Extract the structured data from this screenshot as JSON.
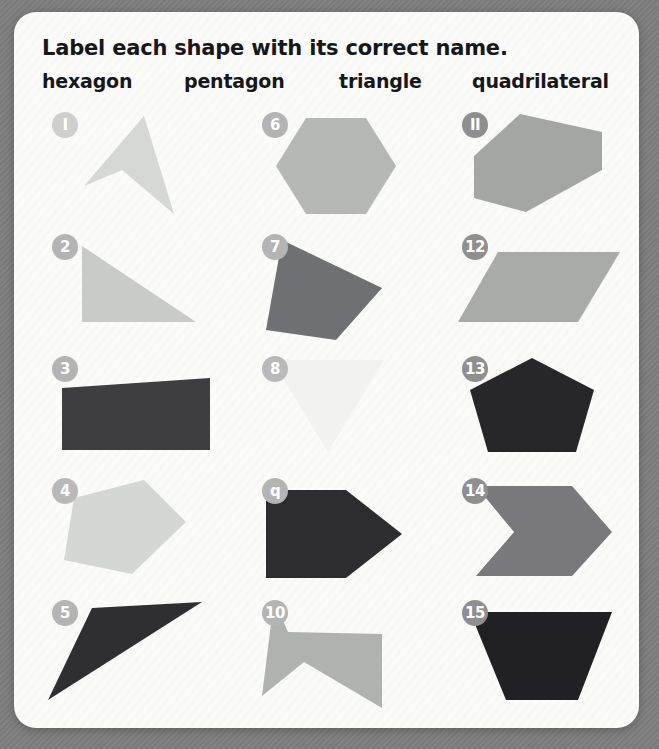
{
  "page": {
    "background_color": "#7e7e7e",
    "card_color": "#fbfbfa"
  },
  "header": {
    "instruction": "Label each shape with its correct name.",
    "word_bank": [
      "hexagon",
      "pentagon",
      "triangle",
      "quadrilateral"
    ]
  },
  "grid": {
    "columns": 3,
    "rows": 5,
    "column_x": [
      30,
      240,
      440
    ],
    "row_y": [
      0,
      122,
      244,
      366,
      488
    ]
  },
  "shapes": [
    {
      "number": "1",
      "badge_label": "I",
      "badge_color": "#cfcfcf",
      "fill": "#d6d8d5",
      "shape_kind": "concave-quadrilateral",
      "points": "100,8 130,106 78,62 40,78",
      "col": 0,
      "row": 0
    },
    {
      "number": "2",
      "badge_label": "2",
      "badge_color": "#b4b4b4",
      "fill": "#c9cbc8",
      "shape_kind": "right-triangle",
      "points": "38,16 38,92 152,92",
      "col": 0,
      "row": 1
    },
    {
      "number": "3",
      "badge_label": "3",
      "badge_color": "#b4b4b4",
      "fill": "#3e3e40",
      "shape_kind": "slanted-quadrilateral",
      "points": "18,36 166,26 166,98 18,98",
      "col": 0,
      "row": 2
    },
    {
      "number": "4",
      "badge_label": "4",
      "badge_color": "#b9b9b9",
      "fill": "#d5d7d4",
      "shape_kind": "rotated-pentagon",
      "points": "30,24 100,6 142,48 88,100 20,86",
      "col": 0,
      "row": 3
    },
    {
      "number": "5",
      "badge_label": "5",
      "badge_color": "#b4b4b4",
      "fill": "#2f2f31",
      "shape_kind": "thin-triangle",
      "points": "48,12 158,6 4,104",
      "col": 0,
      "row": 4
    },
    {
      "number": "6",
      "badge_label": "6",
      "badge_color": "#b4b4b4",
      "fill": "#b6b8b5",
      "shape_kind": "hexagon",
      "points": "52,10 112,10 142,58 112,106 52,106 22,58",
      "col": 1,
      "row": 0
    },
    {
      "number": "7",
      "badge_label": "7",
      "badge_color": "#b4b4b4",
      "fill": "#6e7072",
      "shape_kind": "quadrilateral-kite",
      "points": "28,10 128,58 82,110 12,100",
      "col": 1,
      "row": 1
    },
    {
      "number": "8",
      "badge_label": "8",
      "badge_color": "#b9b9b9",
      "fill": "#f2f2f0",
      "shape_kind": "inverted-triangle",
      "points": "18,8 130,8 74,100",
      "col": 1,
      "row": 2
    },
    {
      "number": "9",
      "badge_label": "q",
      "badge_color": "#b4b4b4",
      "fill": "#2d2d2f",
      "shape_kind": "arrow-pentagon",
      "points": "12,16 92,16 148,60 92,104 12,104",
      "col": 1,
      "row": 3
    },
    {
      "number": "10",
      "badge_label": "10",
      "badge_color": "#b4b4b4",
      "fill": "#b0b2af",
      "shape_kind": "concave-hexagon",
      "points": "20,4 34,36 128,38 128,112 50,66 8,100",
      "col": 1,
      "row": 4
    },
    {
      "number": "11",
      "badge_label": "II",
      "badge_color": "#8f8f8f",
      "fill": "#a4a6a3",
      "shape_kind": "elongated-hexagon",
      "points": "66,6 148,24 148,62 72,104 20,90 20,48",
      "col": 2,
      "row": 0
    },
    {
      "number": "12",
      "badge_label": "12",
      "badge_color": "#8f8f8f",
      "fill": "#a9aba8",
      "shape_kind": "parallelogram",
      "points": "44,22 166,22 124,92 4,92",
      "col": 2,
      "row": 1
    },
    {
      "number": "13",
      "badge_label": "13",
      "badge_color": "#8f8f8f",
      "fill": "#272729",
      "shape_kind": "pentagon",
      "points": "78,6 140,38 122,100 34,100 16,38",
      "col": 2,
      "row": 2
    },
    {
      "number": "14",
      "badge_label": "14",
      "badge_color": "#8f8f8f",
      "fill": "#79797b",
      "shape_kind": "chevron-hexagon",
      "points": "22,12 118,12 158,58 118,102 22,102 60,58",
      "col": 2,
      "row": 3
    },
    {
      "number": "15",
      "badge_label": "15",
      "badge_color": "#8f8f8f",
      "fill": "#212123",
      "shape_kind": "trapezoid",
      "points": "16,16 158,16 124,104 52,104",
      "col": 2,
      "row": 4
    }
  ]
}
